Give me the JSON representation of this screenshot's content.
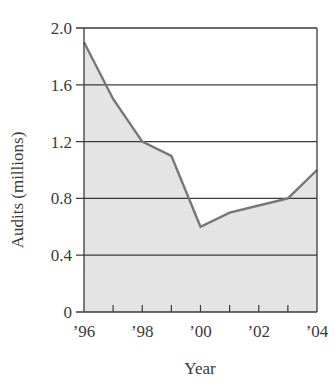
{
  "chart_data": {
    "type": "area",
    "title": "",
    "xlabel": "Year",
    "ylabel": "Audits (millions)",
    "x": [
      "1996",
      "1997",
      "1998",
      "1999",
      "2000",
      "2001",
      "2002",
      "2003",
      "2004"
    ],
    "series": [
      {
        "name": "Audits",
        "values": [
          1.9,
          1.5,
          1.2,
          1.1,
          0.6,
          0.7,
          0.75,
          0.8,
          1.0
        ]
      }
    ],
    "x_tick_labels": [
      "’96",
      "’98",
      "’00",
      "’02",
      "’04"
    ],
    "y_tick_labels": [
      "0",
      "0.4",
      "0.8",
      "1.2",
      "1.6",
      "2.0"
    ],
    "y_ticks": [
      0,
      0.4,
      0.8,
      1.2,
      1.6,
      2.0
    ],
    "ylim": [
      0,
      2.0
    ],
    "xlim": [
      1996,
      2004
    ],
    "grid": "horizontal",
    "legend": "none",
    "colors": {
      "fill": "#e4e4e4",
      "line": "#777777",
      "grid": "#3a3a3a",
      "text": "#3a3a3a"
    }
  }
}
